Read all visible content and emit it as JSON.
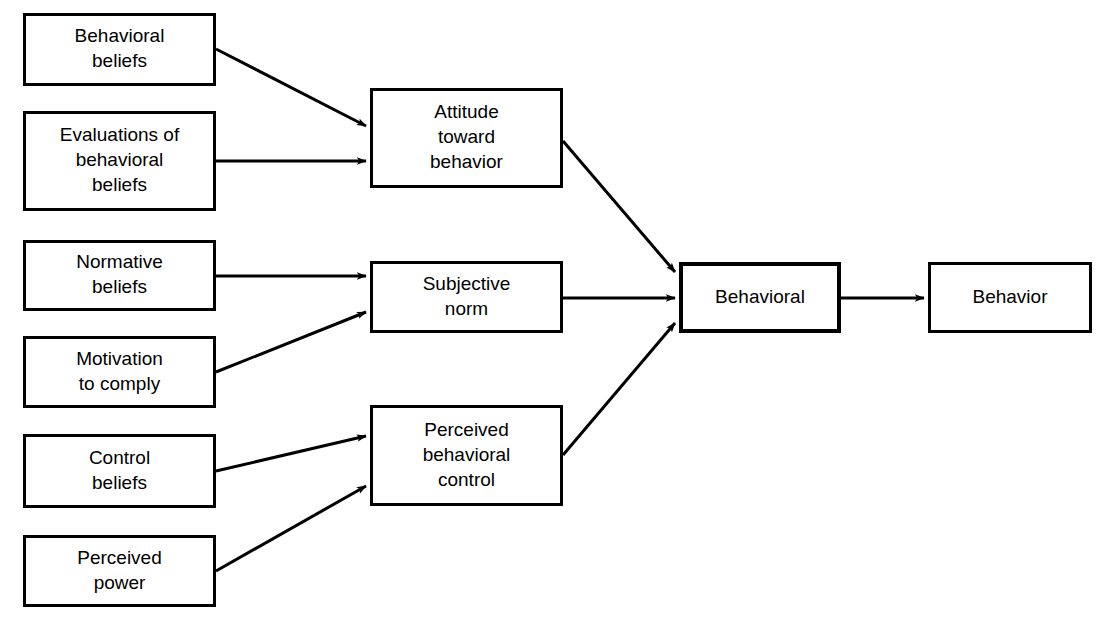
{
  "diagram": {
    "background_color": "#ffffff",
    "stroke_color": "#000000",
    "fill_color": "#ffffff",
    "nodes": [
      {
        "id": "behavioral-beliefs",
        "lines": [
          "Behavioral",
          "beliefs"
        ],
        "x": 23,
        "y": 13,
        "w": 193,
        "h": 73,
        "stroke_width": 3
      },
      {
        "id": "evaluations-of-behavioral-beliefs",
        "lines": [
          "Evaluations of",
          "behavioral",
          "beliefs"
        ],
        "x": 23,
        "y": 111,
        "w": 193,
        "h": 100,
        "stroke_width": 3
      },
      {
        "id": "normative-beliefs",
        "lines": [
          "Normative",
          "beliefs"
        ],
        "x": 23,
        "y": 240,
        "w": 193,
        "h": 71,
        "stroke_width": 3
      },
      {
        "id": "motivation-to-comply",
        "lines": [
          "Motivation",
          "to comply"
        ],
        "x": 23,
        "y": 336,
        "w": 193,
        "h": 72,
        "stroke_width": 3
      },
      {
        "id": "control-beliefs",
        "lines": [
          "Control",
          "beliefs"
        ],
        "x": 23,
        "y": 434,
        "w": 193,
        "h": 74,
        "stroke_width": 3
      },
      {
        "id": "perceived-power",
        "lines": [
          "Perceived",
          "power"
        ],
        "x": 23,
        "y": 535,
        "w": 193,
        "h": 72,
        "stroke_width": 3
      },
      {
        "id": "attitude-toward-behavior",
        "lines": [
          "Attitude",
          "toward",
          "behavior"
        ],
        "x": 370,
        "y": 88,
        "w": 193,
        "h": 100,
        "stroke_width": 3
      },
      {
        "id": "subjective-norm",
        "lines": [
          "Subjective",
          "norm"
        ],
        "x": 370,
        "y": 261,
        "w": 193,
        "h": 72,
        "stroke_width": 3
      },
      {
        "id": "perceived-behavioral-control",
        "lines": [
          "Perceived",
          "behavioral",
          "control"
        ],
        "x": 370,
        "y": 405,
        "w": 193,
        "h": 101,
        "stroke_width": 3
      },
      {
        "id": "behavioral-intention",
        "lines": [
          "Behavioral"
        ],
        "x": 679,
        "y": 262,
        "w": 162,
        "h": 71,
        "stroke_width": 4
      },
      {
        "id": "behavior",
        "lines": [
          "Behavior"
        ],
        "x": 928,
        "y": 262,
        "w": 164,
        "h": 71,
        "stroke_width": 3
      }
    ],
    "edges": [
      {
        "id": "behavioral-beliefs-to-attitude",
        "from": "behavioral-beliefs",
        "to": "attitude-toward-behavior",
        "x1": 216,
        "y1": 49,
        "x2": 366,
        "y2": 126,
        "stroke_width": 3
      },
      {
        "id": "evaluations-to-attitude",
        "from": "evaluations-of-behavioral-beliefs",
        "to": "attitude-toward-behavior",
        "x1": 216,
        "y1": 161,
        "x2": 366,
        "y2": 161,
        "stroke_width": 3
      },
      {
        "id": "normative-beliefs-to-subjective-norm",
        "from": "normative-beliefs",
        "to": "subjective-norm",
        "x1": 216,
        "y1": 276,
        "x2": 366,
        "y2": 276,
        "stroke_width": 3
      },
      {
        "id": "motivation-to-subjective-norm",
        "from": "motivation-to-comply",
        "to": "subjective-norm",
        "x1": 216,
        "y1": 372,
        "x2": 366,
        "y2": 312,
        "stroke_width": 3
      },
      {
        "id": "control-beliefs-to-pbc",
        "from": "control-beliefs",
        "to": "perceived-behavioral-control",
        "x1": 216,
        "y1": 471,
        "x2": 366,
        "y2": 436,
        "stroke_width": 3
      },
      {
        "id": "perceived-power-to-pbc",
        "from": "perceived-power",
        "to": "perceived-behavioral-control",
        "x1": 216,
        "y1": 571,
        "x2": 366,
        "y2": 486,
        "stroke_width": 3
      },
      {
        "id": "attitude-to-behavioral-intention",
        "from": "attitude-toward-behavior",
        "to": "behavioral-intention",
        "x1": 563,
        "y1": 141,
        "x2": 675,
        "y2": 272,
        "stroke_width": 3
      },
      {
        "id": "subjective-norm-to-behavioral-intention",
        "from": "subjective-norm",
        "to": "behavioral-intention",
        "x1": 563,
        "y1": 298,
        "x2": 675,
        "y2": 298,
        "stroke_width": 3
      },
      {
        "id": "pbc-to-behavioral-intention",
        "from": "perceived-behavioral-control",
        "to": "behavioral-intention",
        "x1": 563,
        "y1": 455,
        "x2": 675,
        "y2": 323,
        "stroke_width": 3
      },
      {
        "id": "behavioral-intention-to-behavior",
        "from": "behavioral-intention",
        "to": "behavior",
        "x1": 841,
        "y1": 298,
        "x2": 924,
        "y2": 298,
        "stroke_width": 3
      }
    ]
  }
}
